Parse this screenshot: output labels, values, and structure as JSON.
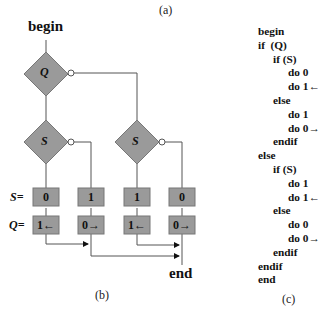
{
  "captions": {
    "a": "(a)",
    "b": "(b)",
    "c": "(c)"
  },
  "flowchart": {
    "begin": "begin",
    "end": "end",
    "decision_q": "Q",
    "decision_s_left": "S",
    "decision_s_right": "S",
    "row_labels": {
      "s": "S=",
      "q": "Q="
    },
    "s_row": [
      "0",
      "1",
      "1",
      "0"
    ],
    "q_row": [
      "1←",
      "0→",
      "1←",
      "0→"
    ]
  },
  "code": {
    "lines": [
      {
        "indent": 0,
        "text": "begin"
      },
      {
        "indent": 0,
        "text": "if  (Q)"
      },
      {
        "indent": 1,
        "text": "if (S)"
      },
      {
        "indent": 2,
        "text": "do 0"
      },
      {
        "indent": 2,
        "text": "do 1←"
      },
      {
        "indent": 1,
        "text": "else"
      },
      {
        "indent": 2,
        "text": "do 1"
      },
      {
        "indent": 2,
        "text": "do 0→"
      },
      {
        "indent": 1,
        "text": "endif"
      },
      {
        "indent": 0,
        "text": "else"
      },
      {
        "indent": 1,
        "text": "if (S)"
      },
      {
        "indent": 2,
        "text": "do 1"
      },
      {
        "indent": 2,
        "text": "do 1←"
      },
      {
        "indent": 1,
        "text": "else"
      },
      {
        "indent": 2,
        "text": "do 0"
      },
      {
        "indent": 2,
        "text": "do 0→"
      },
      {
        "indent": 1,
        "text": "endif"
      },
      {
        "indent": 0,
        "text": "endif"
      },
      {
        "indent": 0,
        "text": "end"
      }
    ]
  },
  "colors": {
    "shape_fill": "#9a9a9a",
    "shape_stroke": "#666666",
    "line": "#555555"
  }
}
